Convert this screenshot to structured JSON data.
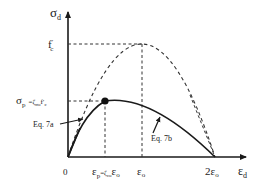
{
  "diagram": {
    "type": "stress-strain-curve",
    "y_axis": {
      "label": "σ",
      "label_sub": "d"
    },
    "x_axis": {
      "label": "ε",
      "label_sub": "d"
    },
    "y_marks": {
      "fc": {
        "main": "f",
        "sup": "′",
        "sub": "c"
      },
      "sigma_p": {
        "main": "σ",
        "sub": "p",
        "eq": "=ζ",
        "eq_sub": "σo",
        "tail": "f′",
        "tail_sub": "c"
      }
    },
    "x_marks": {
      "origin": "0",
      "eps_p": {
        "main": "ε",
        "sub": "p",
        "eq": "=ζ",
        "eq_sub": "εo",
        "tail": "ε",
        "tail_sub": "o"
      },
      "eps_o": {
        "main": "ε",
        "sub": "o"
      },
      "two_eps_o": {
        "main": "2ε",
        "sub": "o"
      }
    },
    "annotations": {
      "eq7a": "Eq. 7a",
      "eq7b": "Eq. 7b"
    },
    "colors": {
      "ink": "#1a1a1a",
      "dash": "#333333"
    }
  }
}
